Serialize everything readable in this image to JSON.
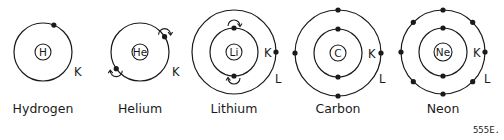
{
  "figure_id": "555E.",
  "colors": {
    "line": "#1a1a1a",
    "background": "#ffffff"
  },
  "atoms": [
    {
      "name": "Hydrogen",
      "symbol": "H",
      "cx": 43,
      "cy": 52,
      "nucleus_r": 8,
      "shells": [
        {
          "label": "K",
          "r": 29,
          "label_x": 74,
          "label_y": 76,
          "electrons": [
            {
              "angle": -68
            }
          ]
        }
      ],
      "name_x": 43,
      "name_y": 113
    },
    {
      "name": "Helium",
      "symbol": "He",
      "cx": 140,
      "cy": 52,
      "nucleus_r": 8,
      "shells": [
        {
          "label": "K",
          "r": 29,
          "label_x": 172,
          "label_y": 76,
          "electrons": [
            {
              "angle": -32,
              "spin": "up"
            },
            {
              "angle": 145,
              "spin": "down"
            }
          ]
        }
      ],
      "name_x": 140,
      "name_y": 113
    },
    {
      "name": "Lithium",
      "symbol": "Li",
      "cx": 234,
      "cy": 52,
      "nucleus_r": 8,
      "shells": [
        {
          "label": "K",
          "r": 24,
          "label_x": 264,
          "label_y": 57,
          "electrons": [
            {
              "angle": -90,
              "spin": "up"
            },
            {
              "angle": 90,
              "spin": "down"
            }
          ]
        },
        {
          "label": "L",
          "r": 42,
          "label_x": 275,
          "label_y": 83,
          "electrons": [
            {
              "angle": 0
            }
          ]
        }
      ],
      "name_x": 234,
      "name_y": 113
    },
    {
      "name": "Carbon",
      "symbol": "C",
      "cx": 338,
      "cy": 53,
      "nucleus_r": 8,
      "shells": [
        {
          "label": "K",
          "r": 24,
          "label_x": 368,
          "label_y": 58,
          "electrons": [
            {
              "angle": -90
            },
            {
              "angle": 90
            }
          ]
        },
        {
          "label": "L",
          "r": 43,
          "label_x": 379,
          "label_y": 83,
          "electrons": [
            {
              "angle": -90
            },
            {
              "angle": 0
            },
            {
              "angle": 90
            },
            {
              "angle": 180
            }
          ]
        }
      ],
      "name_x": 338,
      "name_y": 113
    },
    {
      "name": "Neon",
      "symbol": "Ne",
      "cx": 443,
      "cy": 52,
      "nucleus_r": 9,
      "shells": [
        {
          "label": "K",
          "r": 24,
          "label_x": 473,
          "label_y": 57,
          "electrons": [
            {
              "angle": -90
            },
            {
              "angle": 90
            }
          ]
        },
        {
          "label": "L",
          "r": 42,
          "label_x": 484,
          "label_y": 83,
          "electrons": [
            {
              "angle": -90
            },
            {
              "angle": -45
            },
            {
              "angle": 0
            },
            {
              "angle": 45
            },
            {
              "angle": 90
            },
            {
              "angle": 135
            },
            {
              "angle": 180
            },
            {
              "angle": 225
            }
          ]
        }
      ],
      "name_x": 443,
      "name_y": 113
    }
  ]
}
